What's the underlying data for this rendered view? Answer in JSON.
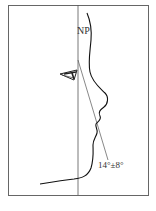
{
  "diagram": {
    "type": "facial-profile-angle",
    "labels": {
      "np": "NP",
      "angle": "14°±8°"
    },
    "colors": {
      "line": "#333333",
      "frame": "#555555",
      "background": "#ffffff"
    }
  }
}
